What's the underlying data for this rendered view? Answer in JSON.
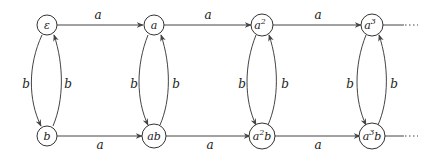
{
  "diagram": {
    "type": "automaton",
    "nodes": [
      {
        "id": "e",
        "base": "ε",
        "sup": "",
        "suffix": "",
        "x": 47,
        "y": 25
      },
      {
        "id": "b",
        "base": "b",
        "sup": "",
        "suffix": "",
        "x": 47,
        "y": 136
      },
      {
        "id": "a",
        "base": "a",
        "sup": "",
        "suffix": "",
        "x": 154,
        "y": 25
      },
      {
        "id": "ab",
        "base": "ab",
        "sup": "",
        "suffix": "",
        "x": 154,
        "y": 136
      },
      {
        "id": "a2",
        "base": "a",
        "sup": "2",
        "suffix": "",
        "x": 262,
        "y": 25
      },
      {
        "id": "a2b",
        "base": "a",
        "sup": "2",
        "suffix": "b",
        "x": 262,
        "y": 136
      },
      {
        "id": "a3",
        "base": "a",
        "sup": "3",
        "suffix": "",
        "x": 372,
        "y": 25
      },
      {
        "id": "a3b",
        "base": "a",
        "sup": "3",
        "suffix": "b",
        "x": 372,
        "y": 136
      }
    ],
    "edges": [
      {
        "from": "e",
        "to": "a",
        "label": "a"
      },
      {
        "from": "a",
        "to": "a2",
        "label": "a"
      },
      {
        "from": "a2",
        "to": "a3",
        "label": "a"
      },
      {
        "from": "b",
        "to": "ab",
        "label": "a"
      },
      {
        "from": "ab",
        "to": "a2b",
        "label": "a"
      },
      {
        "from": "a2b",
        "to": "a3b",
        "label": "a"
      },
      {
        "from": "e",
        "to": "b",
        "label": "b"
      },
      {
        "from": "b",
        "to": "e",
        "label": "b"
      },
      {
        "from": "a",
        "to": "ab",
        "label": "b"
      },
      {
        "from": "ab",
        "to": "a",
        "label": "b"
      },
      {
        "from": "a2",
        "to": "a2b",
        "label": "b"
      },
      {
        "from": "a2b",
        "to": "a2",
        "label": "b"
      },
      {
        "from": "a3",
        "to": "a3b",
        "label": "b"
      },
      {
        "from": "a3b",
        "to": "a3",
        "label": "b"
      }
    ],
    "continuation": "⋯",
    "labels": {
      "a": "a",
      "b": "b"
    }
  }
}
